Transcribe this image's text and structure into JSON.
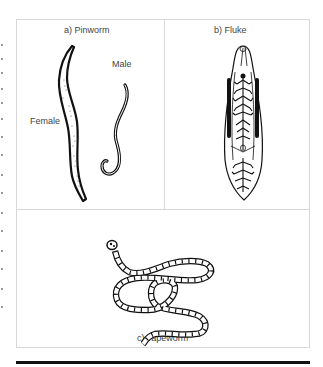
{
  "figure": {
    "panels": [
      {
        "id": "a",
        "title": "a)  Pinworm",
        "labels": {
          "female": "Female",
          "male": "Male"
        }
      },
      {
        "id": "b",
        "title": "b)  Fluke"
      },
      {
        "id": "c",
        "title": "c)  Tapeworm"
      }
    ],
    "colors": {
      "border": "#d8d8d8",
      "ink": "#111111",
      "text": "#444444",
      "rule": "#111111"
    }
  }
}
